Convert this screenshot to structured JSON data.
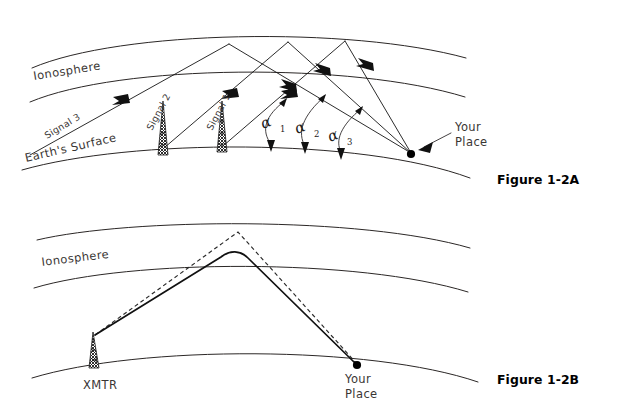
{
  "figure": {
    "panels": [
      {
        "id": "panel-a",
        "caption": "Figure 1-2A",
        "labels": {
          "ionosphere": "Ionosphere",
          "earth_surface": "Earth's Surface",
          "your_place_line1": "Your",
          "your_place_line2": "Place",
          "signal_1": "Signal 1",
          "signal_2": "Signal 2",
          "signal_3": "Signal 3",
          "alpha": "α",
          "alpha_sub_1": "1",
          "alpha_sub_2": "2",
          "alpha_sub_3": "3"
        },
        "icons": {
          "tower_1": "transmitter-tower-icon",
          "tower_2": "transmitter-tower-icon",
          "receiver": "receiver-dot-icon"
        }
      },
      {
        "id": "panel-b",
        "caption": "Figure 1-2B",
        "labels": {
          "ionosphere": "Ionosphere",
          "xmtr": "XMTR",
          "your_place_line1": "Your",
          "your_place_line2": "Place"
        },
        "icons": {
          "tower": "transmitter-tower-icon",
          "receiver": "receiver-dot-icon"
        }
      }
    ],
    "colors": {
      "ink": "#231f20",
      "hand_ink": "#3a3634",
      "paper": "#ffffff",
      "bold_path": "#111111"
    }
  }
}
